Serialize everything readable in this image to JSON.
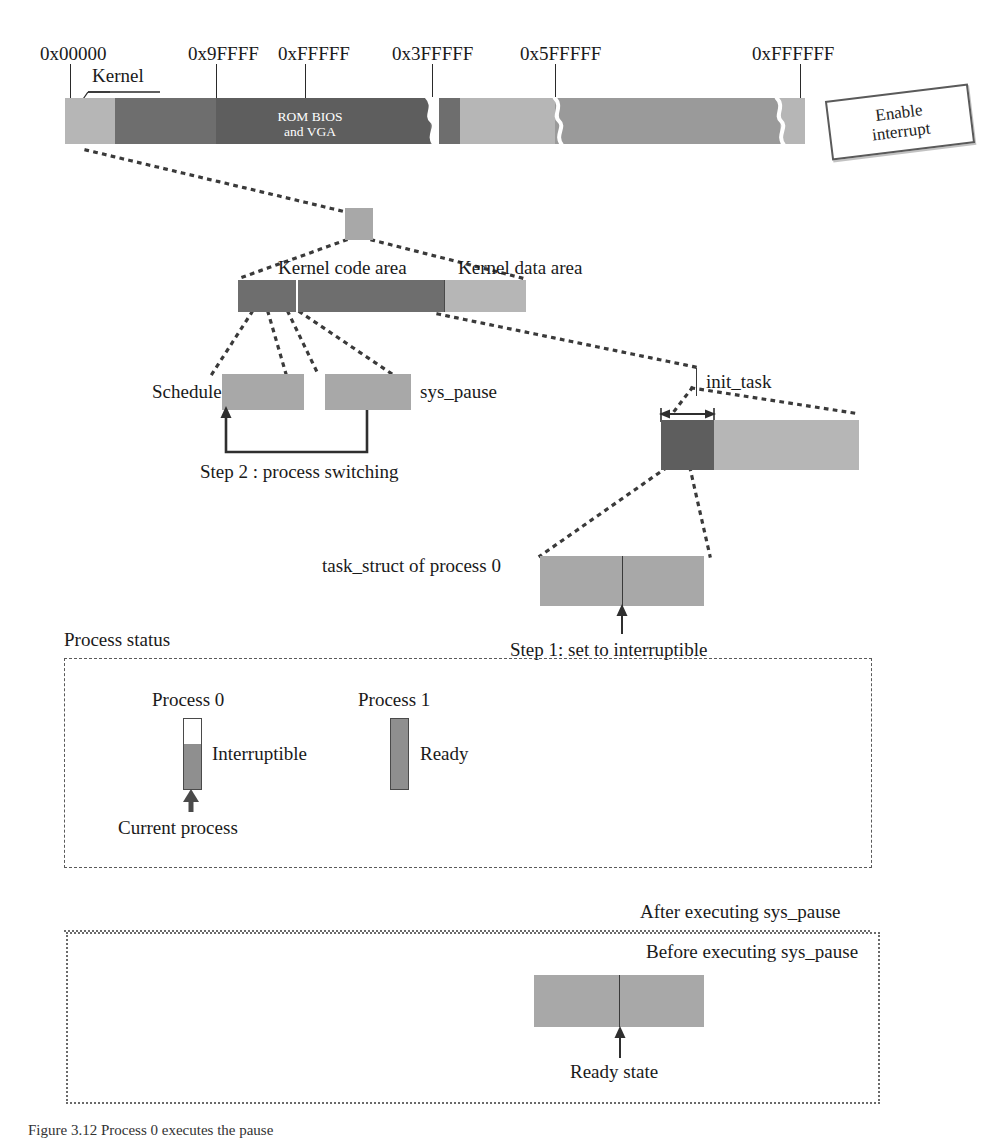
{
  "figure": {
    "caption": "Figure 3.12 Process 0 executes the pause"
  },
  "memory_map": {
    "addresses": [
      {
        "label": "0x00000",
        "x": 40,
        "tick_x": 70
      },
      {
        "label": "0x9FFFF",
        "x": 188,
        "tick_x": 216
      },
      {
        "label": "0xFFFFF",
        "x": 278,
        "tick_x": 305
      },
      {
        "label": "0x3FFFFF",
        "x": 392,
        "tick_x": 432
      },
      {
        "label": "0x5FFFFF",
        "x": 520,
        "tick_x": 555
      },
      {
        "label": "0xFFFFFF",
        "x": 752,
        "tick_x": 800
      }
    ],
    "kernel_label": "Kernel",
    "rom_label_line1": "ROM BIOS",
    "rom_label_line2": "and VGA",
    "segments": [
      {
        "name": "kernel",
        "left": 0,
        "width": 50,
        "shade": "seg-light"
      },
      {
        "name": "low-memory",
        "left": 50,
        "width": 101,
        "shade": "seg-dark"
      },
      {
        "name": "rom-bios-vga",
        "left": 151,
        "width": 214,
        "shade": "seg-darker"
      },
      {
        "name": "extended-1",
        "left": 365,
        "width": 30,
        "shade": "seg-dark"
      },
      {
        "name": "extended-2",
        "left": 395,
        "width": 95,
        "shade": "seg-light"
      },
      {
        "name": "extended-3",
        "left": 490,
        "width": 225,
        "shade": "seg-mid"
      },
      {
        "name": "extended-4",
        "left": 715,
        "width": 25,
        "shade": "seg-light"
      }
    ]
  },
  "stamp": {
    "line1": "Enable",
    "line2": "interrupt"
  },
  "kernel_area": {
    "code_label": "Kernel code area",
    "data_label": "Kernel data area"
  },
  "routines": {
    "schedule_label": "Schedule",
    "sys_pause_label": "sys_pause",
    "step2_label": "Step 2 : process switching"
  },
  "init_task": {
    "label": "init_task"
  },
  "task_struct": {
    "label": "task_struct of process 0",
    "step1_label": "Step 1: set to interruptible"
  },
  "process_status": {
    "title": "Process status",
    "entries": [
      {
        "name": "Process 0",
        "state": "Interruptible",
        "fill_ratio": 0.64,
        "current": true
      },
      {
        "name": "Process 1",
        "state": "Ready",
        "fill_ratio": 1.0,
        "current": false
      }
    ],
    "current_process_label": "Current process"
  },
  "execution_boxes": {
    "after_label": "After executing sys_pause",
    "before_label": "Before executing sys_pause",
    "ready_state_label": "Ready state"
  },
  "colors": {
    "light": "#b6b6b6",
    "mid": "#9a9a9a",
    "dark": "#6e6e6e",
    "darker": "#5e5e5e",
    "grey": "#a8a8a8",
    "ink": "#2a2a2a",
    "dash": "#5a5a5a"
  }
}
